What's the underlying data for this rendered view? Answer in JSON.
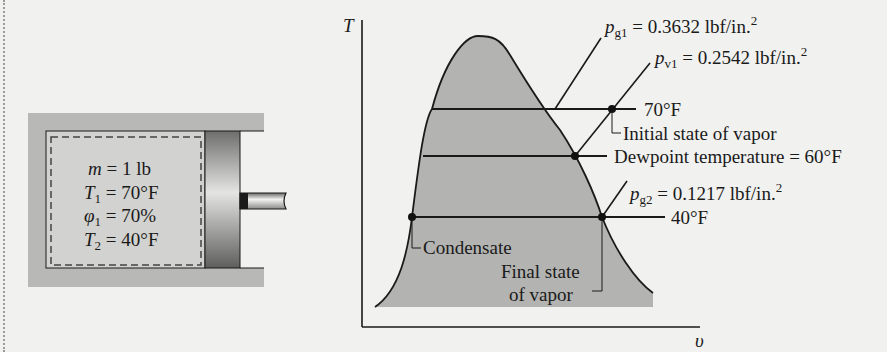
{
  "figure": {
    "cylinder": {
      "labels": [
        {
          "symbol": "m",
          "sub": "",
          "rest": " = 1 lb"
        },
        {
          "symbol": "T",
          "sub": "1",
          "rest": " = 70°F"
        },
        {
          "symbol": "φ",
          "sub": "1",
          "rest": " = 70%"
        },
        {
          "symbol": "T",
          "sub": "2",
          "rest": " = 40°F"
        }
      ]
    },
    "ts_diagram": {
      "y_axis_label": "T",
      "x_axis_label": "υ",
      "pressure_lines": {
        "pg1": {
          "symbol": "p",
          "sub": "g1",
          "rest": " = 0.3632 lbf/in.",
          "sup": "2"
        },
        "pv1": {
          "symbol": "p",
          "sub": "v1",
          "rest": " = 0.2542 lbf/in.",
          "sup": "2"
        },
        "pg2": {
          "symbol": "p",
          "sub": "g2",
          "rest": " = 0.1217 lbf/in.",
          "sup": "2"
        }
      },
      "isotherms": {
        "t70": "70°F",
        "t60": "Dewpoint temperature = 60°F",
        "t40": "40°F"
      },
      "annotations": {
        "initial_state": "Initial state of vapor",
        "condensate": "Condensate",
        "final_state_line1": "Final state",
        "final_state_line2": "of vapor"
      }
    },
    "colors": {
      "background": "#f1f1ef",
      "dome_fill": "#b3b3b1",
      "ink": "#1a1a1a",
      "cylinder_wall": "#b8b8b6",
      "gas_fill": "#cfcfcd"
    }
  }
}
